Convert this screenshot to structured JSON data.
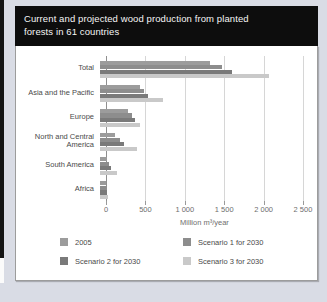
{
  "header": {
    "title": "Current and projected wood production from planted forests in 61 countries",
    "title_lines": [
      "Current and projected wood production from planted",
      "forests in 61 countries"
    ]
  },
  "chart_data": {
    "type": "bar",
    "orientation": "horizontal",
    "title": "Current and projected wood production from planted forests in 61 countries",
    "categories": [
      "Total",
      "Asia and the Pacific",
      "Europe",
      "North and Central America",
      "South America",
      "Africa"
    ],
    "series": [
      {
        "name": "2005",
        "color": "#9c9c9c",
        "values": [
          1390,
          505,
          350,
          195,
          95,
          70
        ]
      },
      {
        "name": "Scenario 1 for 2030",
        "color": "#8d8d8d",
        "values": [
          1550,
          560,
          400,
          250,
          120,
          80
        ]
      },
      {
        "name": "Scenario 2 for 2030",
        "color": "#7a7a7a",
        "values": [
          1670,
          610,
          440,
          305,
          145,
          90
        ]
      },
      {
        "name": "Scenario 3 for 2030",
        "color": "#c9c9c9",
        "values": [
          2140,
          800,
          505,
          470,
          210,
          105
        ]
      }
    ],
    "xlabel": "Million m³/year",
    "x_tick_labels": [
      "0",
      "500",
      "1 000",
      "1 500",
      "2 000",
      "2 500"
    ],
    "xlim": [
      0,
      2500
    ],
    "grid": true,
    "legend_position": "bottom"
  }
}
